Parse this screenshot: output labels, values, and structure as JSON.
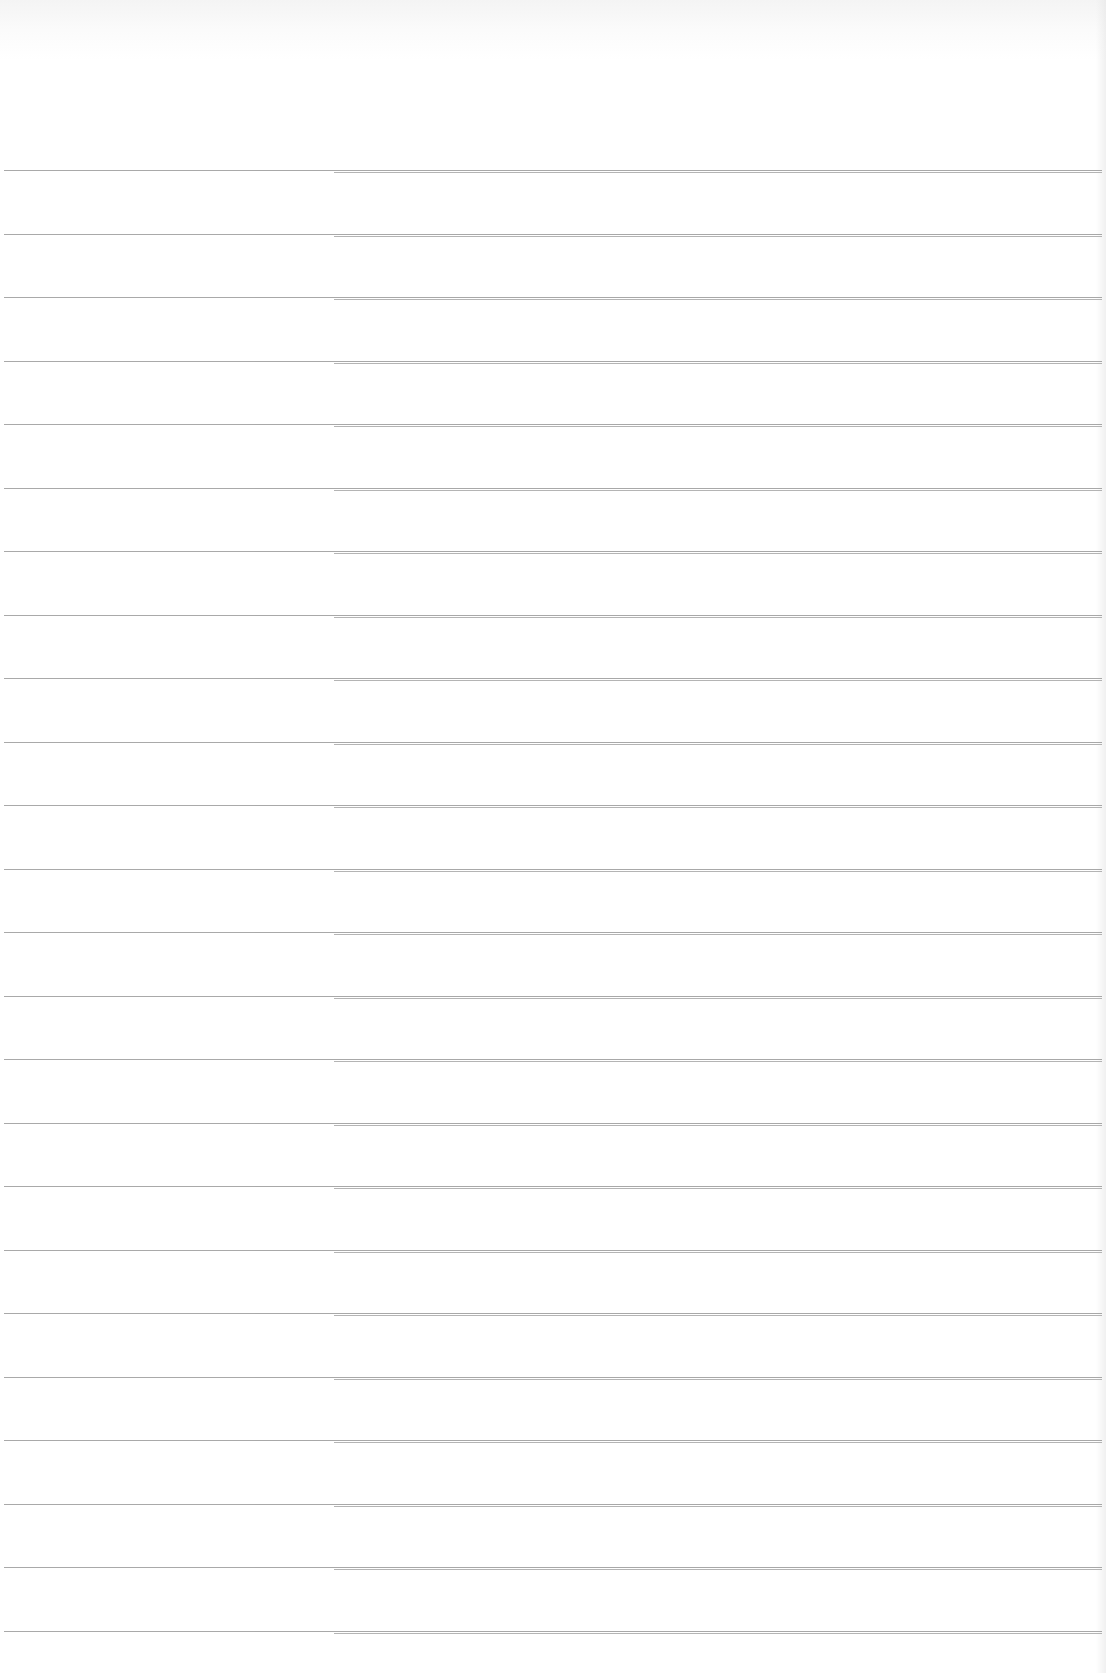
{
  "page": {
    "type": "ruled-paper",
    "background_color": "#ffffff",
    "line_color": "#9a9a9a",
    "line_count": 24,
    "first_line_y": 170,
    "line_spacing_px": 63.5,
    "text": ""
  }
}
